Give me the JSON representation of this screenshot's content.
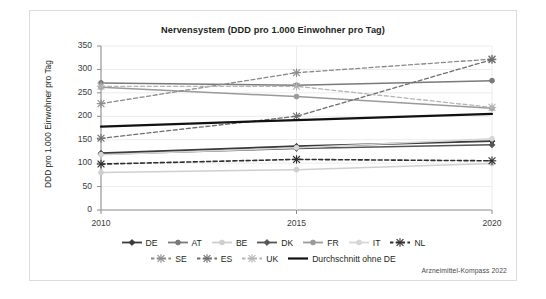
{
  "figure": {
    "title": "Nervensystem (DDD pro 1.000 Einwohner pro Tag)",
    "source_note": "Arzneimittel-Kompass 2022",
    "background": "#ffffff",
    "border_color": "#dcdcdc"
  },
  "chart_data": {
    "type": "line",
    "title": "Nervensystem (DDD pro 1.000 Einwohner pro Tag)",
    "xlabel": "",
    "ylabel": "DDD pro 1.000 Einwohner pro Tag",
    "x": [
      "2010",
      "2015",
      "2020"
    ],
    "categories": [
      "2010",
      "2015",
      "2020"
    ],
    "ylim": [
      0,
      350
    ],
    "yticks": [
      0,
      50,
      100,
      150,
      200,
      250,
      300,
      350
    ],
    "grid": true,
    "legend_position": "bottom",
    "series": [
      {
        "name": "DE",
        "values": [
          121,
          136,
          147
        ],
        "color": "#3a3a3a",
        "style": "solid",
        "marker": "diamond",
        "width": 1.9
      },
      {
        "name": "AT",
        "values": [
          271,
          266,
          276
        ],
        "color": "#7a7a7a",
        "style": "solid",
        "marker": "circle",
        "width": 1.5
      },
      {
        "name": "BE",
        "values": [
          80,
          86,
          99
        ],
        "color": "#cfcfcf",
        "style": "solid",
        "marker": "circle",
        "width": 1.5
      },
      {
        "name": "DK",
        "values": [
          119,
          131,
          139
        ],
        "color": "#555555",
        "style": "solid",
        "marker": "diamond",
        "width": 1.5
      },
      {
        "name": "FR",
        "values": [
          262,
          242,
          217
        ],
        "color": "#9a9a9a",
        "style": "solid",
        "marker": "circle",
        "width": 1.5
      },
      {
        "name": "IT",
        "values": [
          118,
          133,
          152
        ],
        "color": "#d6d6d6",
        "style": "solid",
        "marker": "circle",
        "width": 1.5
      },
      {
        "name": "NL",
        "values": [
          98,
          108,
          105
        ],
        "color": "#2e2e2e",
        "style": "dashed",
        "marker": "star",
        "width": 1.6
      },
      {
        "name": "SE",
        "values": [
          227,
          293,
          322
        ],
        "color": "#8a8a8a",
        "style": "dashed",
        "marker": "star",
        "width": 1.3
      },
      {
        "name": "ES",
        "values": [
          153,
          200,
          321
        ],
        "color": "#6e6e6e",
        "style": "dashed",
        "marker": "star",
        "width": 1.3
      },
      {
        "name": "UK",
        "values": [
          264,
          264,
          219
        ],
        "color": "#b5b5b5",
        "style": "dashed",
        "marker": "star",
        "width": 1.3
      },
      {
        "name": "Durchschnitt ohne DE",
        "values": [
          178,
          192,
          205
        ],
        "color": "#111111",
        "style": "solid",
        "marker": "none",
        "width": 2.2
      }
    ]
  },
  "legend": {
    "rows": [
      [
        {
          "label": "DE",
          "color": "#3a3a3a",
          "style": "solid",
          "marker": "diamond"
        },
        {
          "label": "AT",
          "color": "#7a7a7a",
          "style": "solid",
          "marker": "circle"
        },
        {
          "label": "BE",
          "color": "#cfcfcf",
          "style": "solid",
          "marker": "circle"
        },
        {
          "label": "DK",
          "color": "#555555",
          "style": "solid",
          "marker": "diamond"
        },
        {
          "label": "FR",
          "color": "#9a9a9a",
          "style": "solid",
          "marker": "circle"
        },
        {
          "label": "IT",
          "color": "#d6d6d6",
          "style": "solid",
          "marker": "circle"
        },
        {
          "label": "NL",
          "color": "#2e2e2e",
          "style": "dashed",
          "marker": "star"
        }
      ],
      [
        {
          "label": "SE",
          "color": "#8a8a8a",
          "style": "dashed",
          "marker": "star"
        },
        {
          "label": "ES",
          "color": "#6e6e6e",
          "style": "dashed",
          "marker": "star"
        },
        {
          "label": "UK",
          "color": "#b5b5b5",
          "style": "dashed",
          "marker": "star"
        },
        {
          "label": "Durchschnitt ohne DE",
          "color": "#111111",
          "style": "solid",
          "marker": "none"
        }
      ]
    ]
  }
}
